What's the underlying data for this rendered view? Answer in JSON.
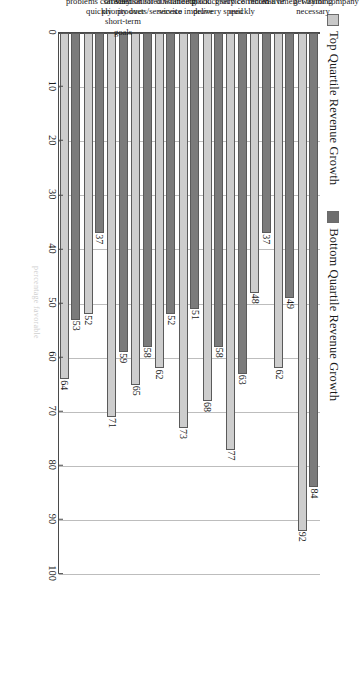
{
  "chart_data": {
    "type": "bar",
    "orientation": "horizontal",
    "title": "",
    "xlabel": "",
    "ylabel": "percentage favorable",
    "ylim": [
      0,
      100
    ],
    "yticks": [
      0,
      10,
      20,
      30,
      40,
      50,
      60,
      70,
      80,
      90,
      100
    ],
    "grid": true,
    "legend_position": "top-left",
    "categories": [
      "Customer problems corrected quickly",
      "Customer satisfaction priority over short-term goals",
      "Customers are very satisfied with products/services",
      "Recognition for outstanding service",
      "Use customer feedback to improve",
      "We increase product/service delivery speed",
      "Problems in group corrected quickly",
      "Encourage to be innovative",
      "Told of changes in a timely way",
      "New employees get training necessary",
      "Proud to work for company"
    ],
    "series": [
      {
        "name": "Top Quartile Revenue Growth",
        "color": "#cdcdcd",
        "values": [
          64,
          52,
          71,
          65,
          62,
          73,
          68,
          77,
          48,
          62,
          92
        ]
      },
      {
        "name": "Bottom Quartile Revenue Growth",
        "color": "#7b7b7b",
        "values": [
          53,
          37,
          59,
          58,
          52,
          51,
          58,
          63,
          37,
          49,
          84
        ]
      }
    ],
    "category_lines": [
      [
        "Customer",
        "problems corrected",
        "quickly"
      ],
      [
        "Customer",
        "satisfaction",
        "priority over",
        "short-term",
        "goals"
      ],
      [
        "Customers are",
        "very satisfied with",
        "products/services"
      ],
      [
        "Recognition",
        "for outstanding",
        "service"
      ],
      [
        "Use customer",
        "feedback",
        "to improve"
      ],
      [
        "We increase",
        "product/service",
        "delivery speed"
      ],
      [
        "Problems in",
        "group corrected",
        "quickly"
      ],
      [
        "Encourage to be",
        "innovative"
      ],
      [
        "Told of changes",
        "in a timely way"
      ],
      [
        "New employees",
        "get training",
        "necessary"
      ],
      [
        "Proud to work",
        "for company"
      ]
    ],
    "groups": [
      {
        "label": "Customer Orientation",
        "lines": [
          "Customer Orientation"
        ],
        "start": 0,
        "end": 3
      },
      {
        "label": "Quality Emphasis",
        "lines": [
          "Quality Emphasis"
        ],
        "start": 3,
        "end": 6
      },
      {
        "label": "Involvement",
        "lines": [
          "Involvement"
        ],
        "start": 6,
        "end": 9
      },
      {
        "label": "Training",
        "lines": [
          "Training"
        ],
        "start": 9,
        "end": 10
      },
      {
        "label": "Organization Satisfaction",
        "lines": [
          "Organization",
          "Satisfaction"
        ],
        "start": 10,
        "end": 11
      }
    ]
  },
  "legend": {
    "items": [
      {
        "label": "Top Quartile Revenue Growth",
        "swatch": "#cdcdcd"
      },
      {
        "label": "Bottom Quartile Revenue Growth",
        "swatch": "#7b7b7b"
      }
    ]
  },
  "axis": {
    "value_axis_title": "percentage favorable",
    "tick_labels": [
      "0",
      "10",
      "20",
      "30",
      "40",
      "50",
      "60",
      "70",
      "80",
      "90",
      "100"
    ]
  }
}
